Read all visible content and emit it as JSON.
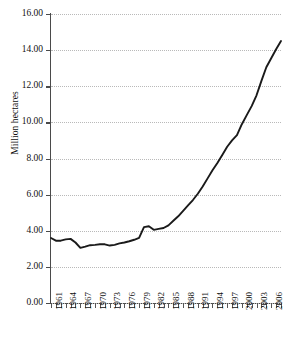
{
  "chart_data": {
    "type": "line",
    "title": "",
    "xlabel": "",
    "ylabel": "Million hectares",
    "ylim": [
      0.0,
      16.0
    ],
    "ytick_step": 2.0,
    "ytick_labels": [
      "0.00",
      "2.00",
      "4.00",
      "6.00",
      "8.00",
      "10.00",
      "12.00",
      "14.00",
      "16.00"
    ],
    "ytick_values": [
      0,
      2,
      4,
      6,
      8,
      10,
      12,
      14,
      16
    ],
    "xlim": [
      1961,
      2008
    ],
    "xtick_interval_years": 1,
    "xtick_label_interval_years": 3,
    "xtick_labels": [
      "1961",
      "1964",
      "1967",
      "1970",
      "1973",
      "1976",
      "1979",
      "1982",
      "1985",
      "1988",
      "1991",
      "1994",
      "1997",
      "2000",
      "2003",
      "2006"
    ],
    "grid": "horizontal-dotted",
    "legend": "none",
    "line_color": "#1a1a1a",
    "grid_color": "#b9b9b9",
    "axis_color": "#4a4a4a",
    "x": [
      1961,
      1962,
      1963,
      1964,
      1965,
      1966,
      1967,
      1968,
      1969,
      1970,
      1971,
      1972,
      1973,
      1974,
      1975,
      1976,
      1977,
      1978,
      1979,
      1980,
      1981,
      1982,
      1983,
      1984,
      1985,
      1986,
      1987,
      1988,
      1989,
      1990,
      1991,
      1992,
      1993,
      1994,
      1995,
      1996,
      1997,
      1998,
      1999,
      2000,
      2001,
      2002,
      2003,
      2004,
      2005,
      2006,
      2007,
      2008
    ],
    "values": [
      3.6,
      3.45,
      3.45,
      3.52,
      3.55,
      3.35,
      3.05,
      3.12,
      3.2,
      3.22,
      3.25,
      3.25,
      3.18,
      3.22,
      3.3,
      3.35,
      3.42,
      3.5,
      3.6,
      4.2,
      4.25,
      4.05,
      4.1,
      4.15,
      4.3,
      4.55,
      4.8,
      5.1,
      5.4,
      5.7,
      6.05,
      6.45,
      6.9,
      7.35,
      7.75,
      8.2,
      8.65,
      9.0,
      9.3,
      9.9,
      10.4,
      10.9,
      11.5,
      12.3,
      13.05,
      13.55,
      14.05,
      14.5
    ]
  }
}
